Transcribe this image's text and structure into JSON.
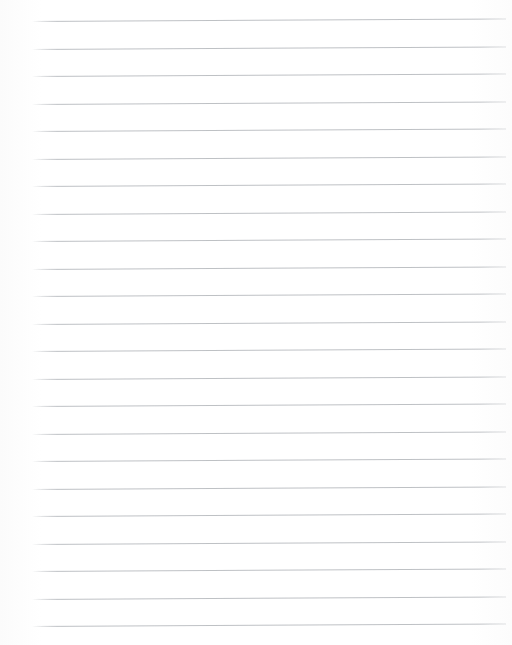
{
  "document": {
    "kind": "ruled-paper-sheet",
    "title": "Blank Ruled Paper",
    "page_width": 512,
    "page_height": 645,
    "background_color": "#fefefe",
    "content_text": ""
  },
  "ruling": {
    "line_color": "#b9bcc0",
    "line_thickness": 1,
    "line_count": 23,
    "left_margin": 32,
    "right_margin": 506,
    "line_length": 474,
    "first_line_y": 21,
    "line_spacing": 27.5,
    "skew_degrees": -0.3,
    "lines": [
      {
        "index": 1,
        "y": 21.0
      },
      {
        "index": 2,
        "y": 48.5
      },
      {
        "index": 3,
        "y": 76.0
      },
      {
        "index": 4,
        "y": 103.5
      },
      {
        "index": 5,
        "y": 131.0
      },
      {
        "index": 6,
        "y": 158.5
      },
      {
        "index": 7,
        "y": 186.0
      },
      {
        "index": 8,
        "y": 213.5
      },
      {
        "index": 9,
        "y": 241.0
      },
      {
        "index": 10,
        "y": 268.5
      },
      {
        "index": 11,
        "y": 296.0
      },
      {
        "index": 12,
        "y": 323.5
      },
      {
        "index": 13,
        "y": 351.0
      },
      {
        "index": 14,
        "y": 378.5
      },
      {
        "index": 15,
        "y": 406.0
      },
      {
        "index": 16,
        "y": 433.5
      },
      {
        "index": 17,
        "y": 461.0
      },
      {
        "index": 18,
        "y": 488.5
      },
      {
        "index": 19,
        "y": 516.0
      },
      {
        "index": 20,
        "y": 543.5
      },
      {
        "index": 21,
        "y": 571.0
      },
      {
        "index": 22,
        "y": 598.5
      },
      {
        "index": 23,
        "y": 626.0
      }
    ]
  }
}
